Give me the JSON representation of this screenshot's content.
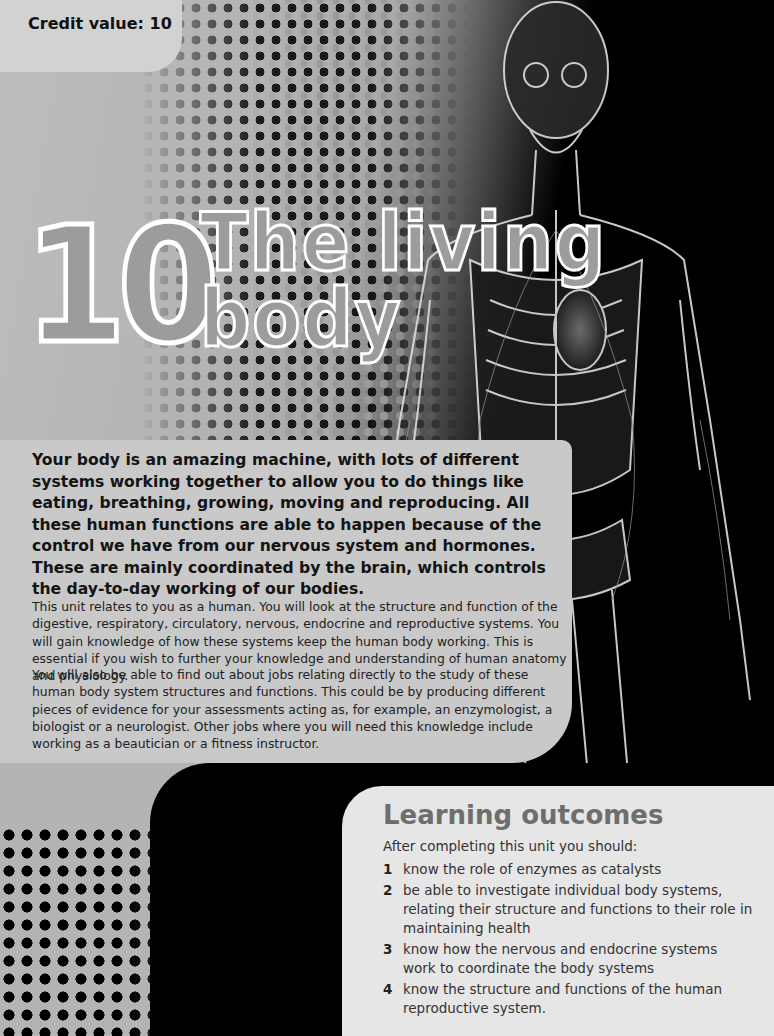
{
  "header": {
    "credit_value": "Credit value: 10"
  },
  "chapter": {
    "number": "10",
    "title_line1": "The living",
    "title_line2": "body"
  },
  "intro": {
    "lead": "Your body is an amazing machine, with lots of different systems working together to allow you to do things like eating, breathing, growing, moving and reproducing. All these human functions are able to happen because of the control we have from our nervous system and hormones. These are mainly coordinated by the brain, which controls the day-to-day working of our bodies.",
    "paragraphs": [
      "This unit relates to you as a human. You will look at the structure and function of the digestive, respiratory, circulatory, nervous, endocrine and reproductive systems. You will gain knowledge of how these systems keep the human body working. This is essential if you wish to further your knowledge and understanding of human anatomy and physiology.",
      "You will also be able to find out about jobs relating directly to the study of these human body system structures and functions. This could be by producing different pieces of evidence for your assessments acting as, for example, an enzymologist, a biologist or a neurologist. Other jobs where you will need this knowledge include working as a beautician or a fitness instructor."
    ]
  },
  "learning_outcomes": {
    "title": "Learning outcomes",
    "intro": "After completing this unit you should:",
    "items": [
      {
        "num": "1",
        "text": "know the role of enzymes as catalysts"
      },
      {
        "num": "2",
        "text": "be able to investigate individual body systems, relating their structure and functions to their role in maintaining health"
      },
      {
        "num": "3",
        "text": "know how the nervous and endocrine systems work to coordinate the body systems"
      },
      {
        "num": "4",
        "text": "know the structure and functions of the human reproductive system."
      }
    ]
  },
  "images": {
    "hero": "x-ray-human-body-figure",
    "decoration": "halftone-dot-pattern"
  }
}
